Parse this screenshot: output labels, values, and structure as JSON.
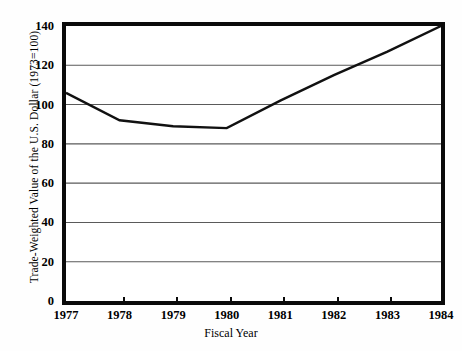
{
  "chart_data": {
    "type": "line",
    "title": "",
    "xlabel": "Fiscal Year",
    "ylabel": "Trade-Weighted Value of the U.S. Dollar (1973=100)",
    "categories": [
      "1977",
      "1978",
      "1979",
      "1980",
      "1981",
      "1982",
      "1983",
      "1984"
    ],
    "x": [
      1977,
      1978,
      1979,
      1980,
      1981,
      1982,
      1983,
      1984
    ],
    "values": [
      106,
      92,
      89,
      88,
      102,
      115,
      127,
      140
    ],
    "series": [
      {
        "name": "Trade-Weighted Value of the U.S. Dollar",
        "values": [
          106,
          92,
          89,
          88,
          102,
          115,
          127,
          140
        ]
      }
    ],
    "xlim": [
      1977,
      1984
    ],
    "ylim": [
      0,
      140
    ],
    "yticks": [
      0,
      20,
      40,
      60,
      80,
      100,
      120,
      140
    ],
    "ytick_labels": [
      "0",
      "20",
      "40",
      "60",
      "80",
      "100",
      "120",
      "140"
    ],
    "xticks": [
      1977,
      1978,
      1979,
      1980,
      1981,
      1982,
      1983,
      1984
    ],
    "xtick_labels": [
      "1977",
      "1978",
      "1979",
      "1980",
      "1981",
      "1982",
      "1983",
      "1984"
    ],
    "grid": "horizontal",
    "legend": "none",
    "line_color": "#111111",
    "grid_color": "#5a5a5a",
    "frame_color": "#0a0a0a",
    "background_color": "#ffffff"
  },
  "axes": {
    "y_title": "Trade-Weighted Value of the U.S. Dollar (1973=100)",
    "x_title": "Fiscal Year",
    "y_ticks": [
      "140",
      "120",
      "100",
      "80",
      "60",
      "40",
      "20",
      "0"
    ],
    "x_ticks": [
      "1977",
      "1978",
      "1979",
      "1980",
      "1981",
      "1982",
      "1983",
      "1984"
    ]
  }
}
